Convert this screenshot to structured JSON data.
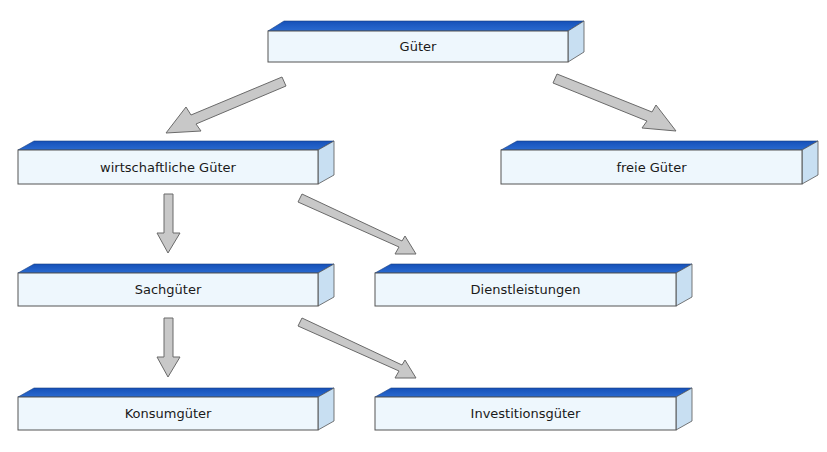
{
  "diagram": {
    "type": "hierarchy",
    "colors": {
      "box_top": "#1f5fc4",
      "box_front": "#eef7fd",
      "box_side": "#c8dff2",
      "box_border": "#555555",
      "arrow_fill": "#c8c8c8",
      "arrow_stroke": "#6a6a6a"
    },
    "nodes": [
      {
        "id": "gueter",
        "label": "Güter"
      },
      {
        "id": "wirtschaftliche",
        "label": "wirtschaftliche Güter"
      },
      {
        "id": "freie",
        "label": "freie Güter"
      },
      {
        "id": "sachgueter",
        "label": "Sachgüter"
      },
      {
        "id": "dienstleistungen",
        "label": "Dienstleistungen"
      },
      {
        "id": "konsumgueter",
        "label": "Konsumgüter"
      },
      {
        "id": "investitionsgueter",
        "label": "Investitionsgüter"
      }
    ],
    "edges": [
      {
        "from": "gueter",
        "to": "wirtschaftliche"
      },
      {
        "from": "gueter",
        "to": "freie"
      },
      {
        "from": "wirtschaftliche",
        "to": "sachgueter"
      },
      {
        "from": "wirtschaftliche",
        "to": "dienstleistungen"
      },
      {
        "from": "sachgueter",
        "to": "konsumgueter"
      },
      {
        "from": "sachgueter",
        "to": "investitionsgueter"
      }
    ]
  }
}
